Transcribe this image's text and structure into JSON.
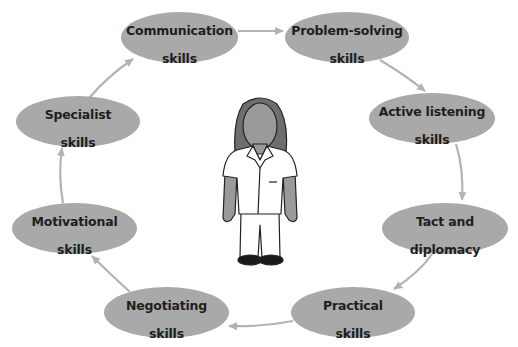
{
  "diagram": {
    "colors": {
      "node_fill": "#a9a9a9",
      "arrow": "#b3b3b3",
      "text": "#1e1e1e",
      "background": "#ffffff"
    },
    "center_figure": {
      "icon": "person-icon",
      "description": "Female care worker in white uniform tunic and trousers"
    },
    "nodes": [
      {
        "id": "communication",
        "line1": "Communication",
        "line2": "skills",
        "x": 121,
        "y": 12,
        "w": 117,
        "h": 51
      },
      {
        "id": "problem-solving",
        "line1": "Problem-solving",
        "line2": "skills",
        "x": 285,
        "y": 12,
        "w": 124,
        "h": 51
      },
      {
        "id": "active-listening",
        "line1": "Active listening",
        "line2": "skills",
        "x": 369,
        "y": 93,
        "w": 126,
        "h": 51
      },
      {
        "id": "tact-diplomacy",
        "line1": "Tact and",
        "line2": "diplomacy",
        "x": 382,
        "y": 203,
        "w": 126,
        "h": 51
      },
      {
        "id": "practical",
        "line1": "Practical",
        "line2": "skills",
        "x": 291,
        "y": 287,
        "w": 124,
        "h": 51
      },
      {
        "id": "negotiating",
        "line1": "Negotiating",
        "line2": "skills",
        "x": 104,
        "y": 287,
        "w": 125,
        "h": 51
      },
      {
        "id": "motivational",
        "line1": "Motivational",
        "line2": "skills",
        "x": 12,
        "y": 203,
        "w": 125,
        "h": 51
      },
      {
        "id": "specialist",
        "line1": "Specialist",
        "line2": "skills",
        "x": 16,
        "y": 96,
        "w": 124,
        "h": 51
      }
    ],
    "arrows": [
      {
        "from": "communication",
        "to": "problem-solving"
      },
      {
        "from": "problem-solving",
        "to": "active-listening"
      },
      {
        "from": "active-listening",
        "to": "tact-diplomacy"
      },
      {
        "from": "tact-diplomacy",
        "to": "practical"
      },
      {
        "from": "practical",
        "to": "negotiating"
      },
      {
        "from": "negotiating",
        "to": "motivational"
      },
      {
        "from": "motivational",
        "to": "specialist"
      },
      {
        "from": "specialist",
        "to": "communication"
      }
    ]
  }
}
